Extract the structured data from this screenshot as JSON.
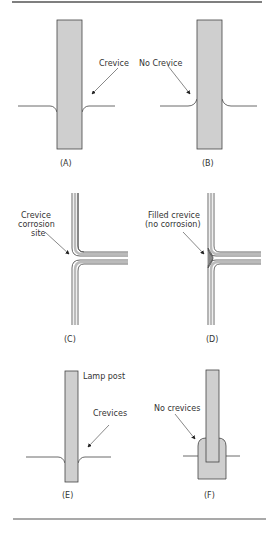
{
  "colors": {
    "fill": "#cfcfcf",
    "stroke": "#444444",
    "filled_crevice": "#8a8a8a",
    "rule": "#555555"
  },
  "panels": [
    {
      "id": "A",
      "caption": "(A)",
      "labels": [
        "Crevice"
      ]
    },
    {
      "id": "B",
      "caption": "(B)",
      "labels": [
        "No Crevice"
      ]
    },
    {
      "id": "C",
      "caption": "(C)",
      "labels": [
        "Crevice",
        "corrosion",
        "site"
      ]
    },
    {
      "id": "D",
      "caption": "(D)",
      "labels": [
        "Filled crevice",
        "(no corrosion)"
      ]
    },
    {
      "id": "E",
      "caption": "(E)",
      "labels": [
        "Lamp post",
        "Crevices"
      ]
    },
    {
      "id": "F",
      "caption": "(F)",
      "labels": [
        "No crevices"
      ]
    }
  ]
}
